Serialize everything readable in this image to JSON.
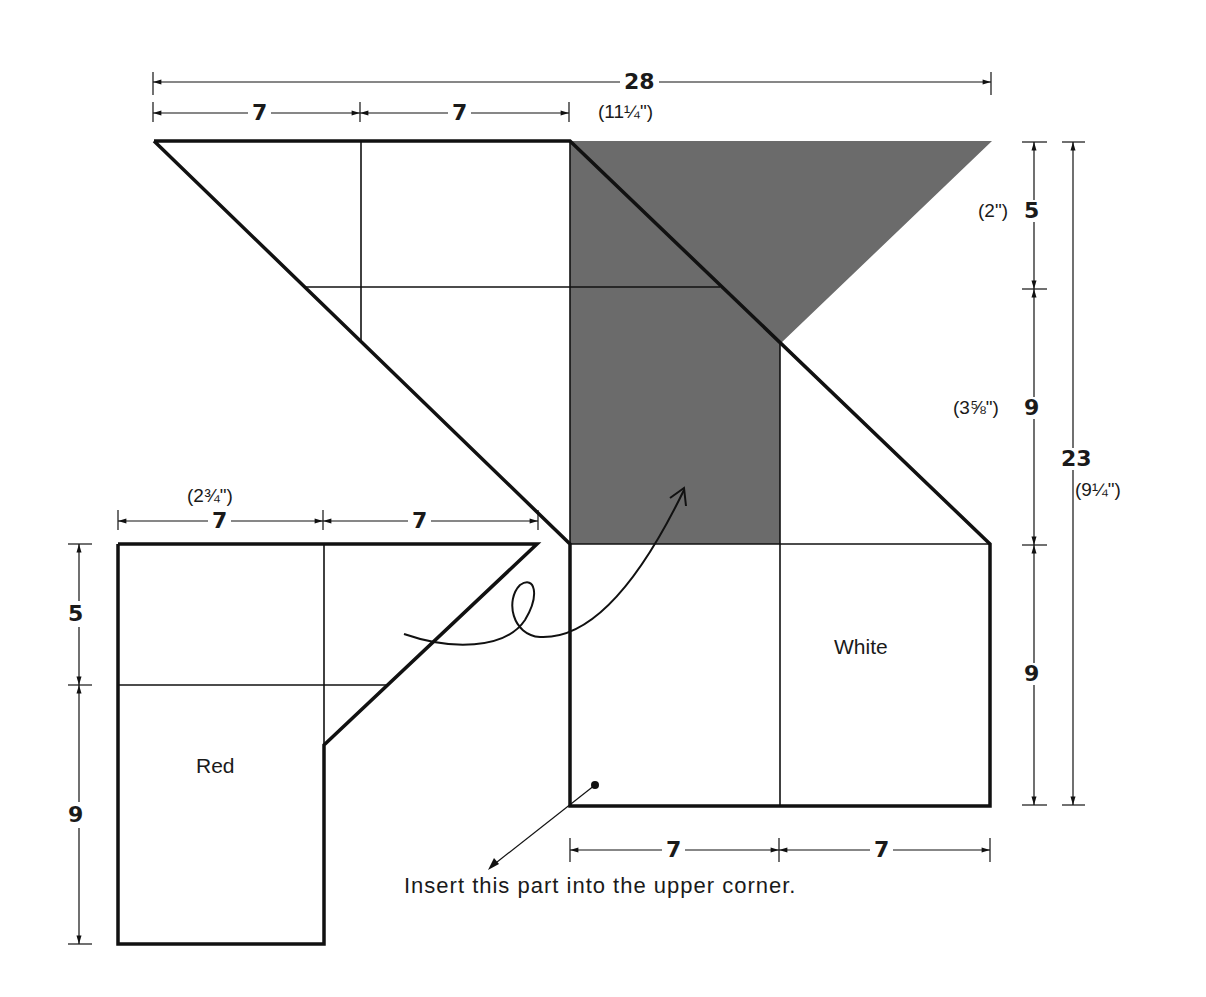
{
  "diagram": {
    "type": "sewing-pattern-assembly",
    "colors": {
      "outline": "#111111",
      "shaded_region": "#6b6b6b",
      "background": "#ffffff"
    },
    "pieces": {
      "white": {
        "label": "White"
      },
      "red": {
        "label": "Red"
      }
    },
    "top_dimensions": {
      "overall": {
        "value": "28",
        "inches": "(11¼\")"
      },
      "segment_1": {
        "value": "7"
      },
      "segment_2": {
        "value": "7"
      }
    },
    "right_dimensions": {
      "segment_top": {
        "value": "5",
        "inches": "(2\")"
      },
      "segment_middle": {
        "value": "9",
        "inches": "(3⅝\")"
      },
      "segment_bottom": {
        "value": "9"
      },
      "overall": {
        "value": "23",
        "inches": "(9¼\")"
      }
    },
    "bottom_dimensions": {
      "segment_1": {
        "value": "7"
      },
      "segment_2": {
        "value": "7"
      }
    },
    "red_piece_dimensions": {
      "top_segment_1": {
        "value": "7",
        "inches": "(2¾\")"
      },
      "top_segment_2": {
        "value": "7"
      },
      "left_segment_top": {
        "value": "5"
      },
      "left_segment_bottom": {
        "value": "9"
      }
    },
    "caption": "Insert this part into the upper corner."
  }
}
